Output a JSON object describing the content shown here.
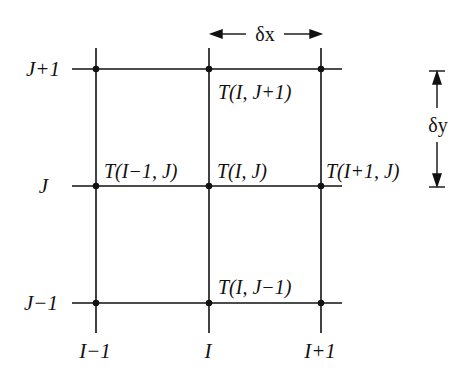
{
  "diagram": {
    "type": "finite-difference-grid",
    "line_color": "#111111",
    "background": "#ffffff",
    "columns": [
      {
        "label": "I−1",
        "x": 96
      },
      {
        "label": "I",
        "x": 209
      },
      {
        "label": "I+1",
        "x": 321
      }
    ],
    "rows": [
      {
        "label": "J+1",
        "y": 69
      },
      {
        "label": "J",
        "y": 186
      },
      {
        "label": "J−1",
        "y": 303
      }
    ],
    "node_labels": [
      {
        "text": "T(I, J+1)",
        "x": 218,
        "y": 99
      },
      {
        "text": "T(I−1, J)",
        "x": 105,
        "y": 175
      },
      {
        "text": "T(I, J)",
        "x": 218,
        "y": 175
      },
      {
        "text": "T(I+1, J)",
        "x": 327,
        "y": 175
      },
      {
        "text": "T(I, J−1)",
        "x": 218,
        "y": 291
      }
    ],
    "spacing": {
      "dx_label": "δx",
      "dy_label": "δy"
    }
  }
}
